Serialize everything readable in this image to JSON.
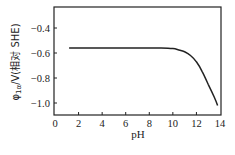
{
  "chart_data": {
    "type": "line",
    "title": "",
    "xlabel": "pH",
    "ylabel": "φ1α/V(相对 SHE)",
    "xlim": [
      0,
      14
    ],
    "ylim": [
      -1.1,
      -0.23
    ],
    "xticks": [
      0,
      2,
      4,
      6,
      8,
      10,
      12,
      14
    ],
    "yticks": [
      -0.4,
      -0.6,
      -0.8,
      -1.0
    ],
    "xtick_labels": [
      "0",
      "2",
      "4",
      "6",
      "8",
      "10",
      "12",
      "14"
    ],
    "ytick_labels": [
      "-0.4",
      "-0.6",
      "-0.8",
      "-1.0"
    ],
    "grid": false,
    "legend": null,
    "series": [
      {
        "name": "φ1α",
        "x": [
          1.2,
          2,
          4,
          6,
          8,
          9,
          10,
          10.5,
          11,
          11.5,
          12,
          12.5,
          13,
          13.5,
          13.8
        ],
        "values": [
          -0.56,
          -0.56,
          -0.56,
          -0.56,
          -0.56,
          -0.56,
          -0.565,
          -0.575,
          -0.59,
          -0.62,
          -0.67,
          -0.75,
          -0.85,
          -0.95,
          -1.02
        ]
      }
    ]
  },
  "labels": {
    "xlabel": "pH",
    "ylabel_main": "φ",
    "ylabel_sub": "1α",
    "ylabel_rest": "/V(相对 SHE)"
  }
}
